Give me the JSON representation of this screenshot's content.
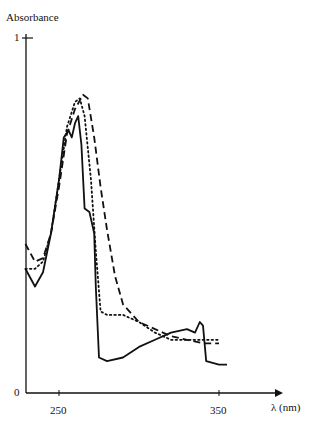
{
  "chart_data": {
    "type": "line",
    "title": "",
    "xlabel": "λ (nm)",
    "ylabel": "Absorbance",
    "xlim": [
      229,
      390
    ],
    "ylim": [
      0,
      1
    ],
    "x_ticks": [
      "250",
      "350"
    ],
    "y_ticks": [
      "0",
      "1"
    ],
    "grid": false,
    "legend": null,
    "series": [
      {
        "name": "solid",
        "style": "solid",
        "points": [
          [
            229,
            0.35
          ],
          [
            235,
            0.3
          ],
          [
            240,
            0.34
          ],
          [
            245,
            0.45
          ],
          [
            250,
            0.6
          ],
          [
            253,
            0.72
          ],
          [
            256,
            0.74
          ],
          [
            258,
            0.72
          ],
          [
            260,
            0.76
          ],
          [
            262,
            0.78
          ],
          [
            264,
            0.7
          ],
          [
            266,
            0.52
          ],
          [
            269,
            0.51
          ],
          [
            272,
            0.45
          ],
          [
            273,
            0.3
          ],
          [
            275,
            0.1
          ],
          [
            280,
            0.09
          ],
          [
            290,
            0.1
          ],
          [
            300,
            0.13
          ],
          [
            310,
            0.15
          ],
          [
            320,
            0.17
          ],
          [
            330,
            0.18
          ],
          [
            335,
            0.17
          ],
          [
            338,
            0.2
          ],
          [
            340,
            0.19
          ],
          [
            342,
            0.09
          ],
          [
            350,
            0.08
          ],
          [
            355,
            0.08
          ]
        ]
      },
      {
        "name": "dotted",
        "style": "dotted",
        "points": [
          [
            229,
            0.35
          ],
          [
            235,
            0.35
          ],
          [
            240,
            0.37
          ],
          [
            245,
            0.45
          ],
          [
            250,
            0.6
          ],
          [
            255,
            0.75
          ],
          [
            260,
            0.82
          ],
          [
            263,
            0.83
          ],
          [
            266,
            0.78
          ],
          [
            270,
            0.6
          ],
          [
            273,
            0.4
          ],
          [
            276,
            0.23
          ],
          [
            280,
            0.22
          ],
          [
            290,
            0.22
          ],
          [
            300,
            0.2
          ],
          [
            310,
            0.17
          ],
          [
            320,
            0.15
          ],
          [
            330,
            0.15
          ],
          [
            340,
            0.15
          ],
          [
            350,
            0.15
          ]
        ]
      },
      {
        "name": "dashed",
        "style": "dashed",
        "points": [
          [
            229,
            0.42
          ],
          [
            235,
            0.37
          ],
          [
            240,
            0.38
          ],
          [
            245,
            0.45
          ],
          [
            250,
            0.58
          ],
          [
            255,
            0.73
          ],
          [
            260,
            0.8
          ],
          [
            265,
            0.84
          ],
          [
            268,
            0.83
          ],
          [
            272,
            0.72
          ],
          [
            276,
            0.58
          ],
          [
            280,
            0.46
          ],
          [
            285,
            0.33
          ],
          [
            290,
            0.25
          ],
          [
            300,
            0.2
          ],
          [
            310,
            0.18
          ],
          [
            320,
            0.16
          ],
          [
            330,
            0.15
          ],
          [
            340,
            0.14
          ],
          [
            350,
            0.14
          ]
        ]
      }
    ]
  }
}
